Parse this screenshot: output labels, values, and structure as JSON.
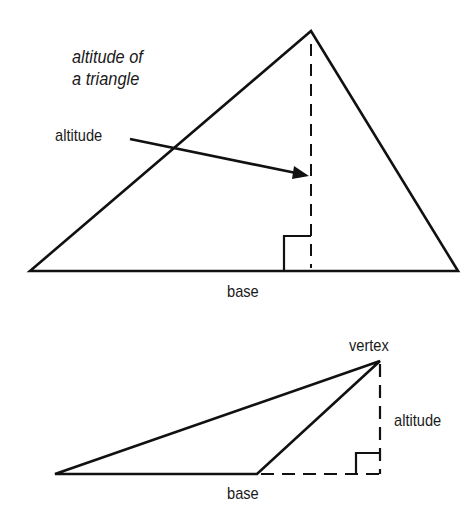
{
  "title": {
    "line1": "altitude of",
    "line2": "a triangle"
  },
  "figure1": {
    "labels": {
      "altitude": "altitude",
      "base": "base"
    },
    "type": "acute triangle with interior altitude"
  },
  "figure2": {
    "labels": {
      "vertex": "vertex",
      "altitude": "altitude",
      "base": "base"
    },
    "type": "obtuse triangle with exterior altitude"
  },
  "colors": {
    "stroke": "#111111",
    "background": "#ffffff"
  }
}
